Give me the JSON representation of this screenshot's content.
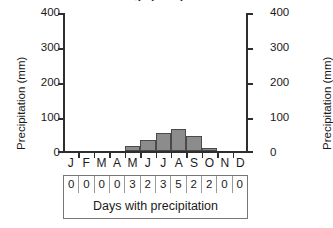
{
  "chart_data": {
    "type": "bar",
    "title": "Average precipitation",
    "title_clipped": true,
    "xlabel": "",
    "ylabel": "Precipitation (mm)",
    "ylabel_right": "Precipitation (mm)",
    "ylim": [
      0,
      400
    ],
    "yticks": [
      0,
      100,
      200,
      300,
      400
    ],
    "yticks_right": [
      0,
      100,
      200,
      300,
      400
    ],
    "grid": false,
    "legend": null,
    "categories": [
      "J",
      "F",
      "M",
      "A",
      "M",
      "J",
      "J",
      "A",
      "S",
      "O",
      "N",
      "D"
    ],
    "values": [
      0,
      0,
      0,
      0,
      15,
      34,
      54,
      64,
      44,
      10,
      0,
      0
    ],
    "table": {
      "caption": "Days with precipitation",
      "values": [
        "0",
        "0",
        "0",
        "0",
        "3",
        "2",
        "3",
        "5",
        "2",
        "2",
        "0",
        "0"
      ]
    }
  },
  "axis": {
    "left": {
      "title": "Precipitation (mm)",
      "labels": [
        "400",
        "300",
        "200",
        "100",
        "0"
      ]
    },
    "right": {
      "title": "Precipitation (mm)",
      "labels": [
        "400",
        "300",
        "200",
        "100",
        "0"
      ]
    }
  },
  "colors": {
    "bar_fill": "#8c8c8c",
    "bar_stroke": "#4a4a4a",
    "axis": "#2e2e2e",
    "text": "#1a1a1a",
    "table_border": "#777777",
    "background": "#ffffff"
  }
}
